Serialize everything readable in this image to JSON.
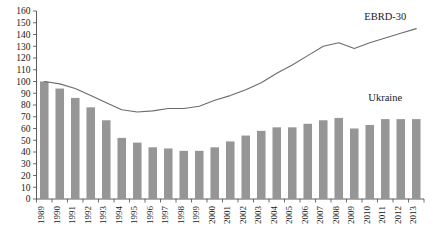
{
  "chart_data": {
    "type": "bar",
    "title": "",
    "subtitle": "",
    "xlabel": "",
    "ylabel": "",
    "ylim": [
      0,
      160
    ],
    "ytick_step": 10,
    "yticks": [
      0,
      10,
      20,
      30,
      40,
      50,
      60,
      70,
      80,
      90,
      100,
      110,
      120,
      130,
      140,
      150,
      160
    ],
    "grid": false,
    "legend_position": "inline-annotation",
    "categories": [
      "1989",
      "1990",
      "1991",
      "1992",
      "1993",
      "1994",
      "1995",
      "1996",
      "1997",
      "1998",
      "1999",
      "2000",
      "2001",
      "2002",
      "2003",
      "2004",
      "2005",
      "2006",
      "2007",
      "2008",
      "2009",
      "2010",
      "2011",
      "2012",
      "2013"
    ],
    "series": [
      {
        "name": "Ukraine",
        "render": "bar",
        "color": "#969696",
        "values": [
          100,
          94,
          86,
          78,
          67,
          52,
          48,
          44,
          43,
          41,
          41,
          44,
          49,
          54,
          58,
          61,
          61,
          64,
          67,
          69,
          60,
          63,
          68,
          68,
          68
        ]
      },
      {
        "name": "EBRD-30",
        "render": "line",
        "color": "#6b6b6b",
        "values": [
          100,
          98,
          94,
          88,
          82,
          76,
          74,
          75,
          77,
          77,
          79,
          84,
          88,
          93,
          99,
          107,
          114,
          122,
          130,
          133,
          128,
          133,
          137,
          141,
          145
        ]
      }
    ],
    "annotations": [
      {
        "name": "ebrd-30-label",
        "text": "EBRD-30",
        "x_category": "2011",
        "y_value": 152
      },
      {
        "name": "ukraine-label",
        "text": "Ukraine",
        "x_category": "2011",
        "y_value": 83
      }
    ]
  }
}
